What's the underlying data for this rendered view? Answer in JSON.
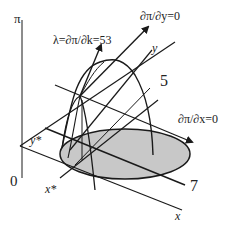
{
  "diagram": {
    "type": "3d-profit-surface",
    "axes": {
      "vertical": "π",
      "x": "x",
      "y": "y",
      "origin": "0"
    },
    "markers": {
      "x_star": "x*",
      "y_star": "y*"
    },
    "constraint_labels": {
      "five": "5",
      "seven": "7"
    },
    "gradient_labels": {
      "lambda": "λ=∂π/∂k=53",
      "dpi_dy": "∂π/∂y=0",
      "dpi_dx": "∂π/∂x=0"
    },
    "colors": {
      "ink": "#1a1a1a",
      "ellipse_fill": "#c8c8c8",
      "background": "#ffffff"
    }
  }
}
